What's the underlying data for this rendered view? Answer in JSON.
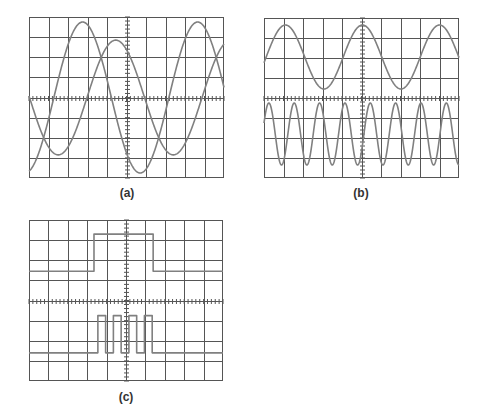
{
  "figure": {
    "style": {
      "grid_color": "#555555",
      "trace_color": "#808080",
      "background": "#ffffff",
      "divisions_x": 10,
      "divisions_y": 8,
      "minor_ticks_per_division": 5
    },
    "panels": [
      {
        "id": "a",
        "label": "(a)",
        "box": {
          "x": 29,
          "y": 17,
          "w": 195,
          "h": 161
        },
        "label_pos": {
          "x": 107,
          "y": 186
        },
        "traces": [
          {
            "name": "trace-1",
            "type": "sine",
            "offset": 0,
            "amplitude": 3.75,
            "period": 5.9,
            "phase_peak_x": 2.75
          },
          {
            "name": "trace-2",
            "type": "sine",
            "offset": 0,
            "amplitude": 2.85,
            "period": 5.9,
            "phase_peak_x": 4.45
          }
        ]
      },
      {
        "id": "b",
        "label": "(b)",
        "box": {
          "x": 264,
          "y": 18,
          "w": 195,
          "h": 160
        },
        "label_pos": {
          "x": 341,
          "y": 186
        },
        "traces": [
          {
            "name": "trace-top",
            "type": "sine",
            "offset": 2.05,
            "amplitude": 1.6,
            "period": 3.95,
            "phase_peak_x": 1.1
          },
          {
            "name": "trace-bottom",
            "type": "sine",
            "offset": -1.8,
            "amplitude": 1.55,
            "period": 1.3,
            "phase_peak_x": 0.25
          }
        ]
      },
      {
        "id": "c",
        "label": "(c)",
        "box": {
          "x": 29,
          "y": 220,
          "w": 194,
          "h": 161
        },
        "label_pos": {
          "x": 106,
          "y": 390
        },
        "traces": [
          {
            "name": "trace-single-pulse",
            "type": "pulses",
            "low": 1.45,
            "high": 3.3,
            "pulses": [
              [
                3.35,
                6.4
              ]
            ]
          },
          {
            "name": "trace-pulse-train",
            "type": "pulses",
            "low": -2.6,
            "high": -0.75,
            "pulses": [
              [
                3.55,
                3.95
              ],
              [
                4.35,
                4.75
              ],
              [
                5.15,
                5.55
              ],
              [
                5.95,
                6.35
              ]
            ]
          }
        ]
      }
    ]
  },
  "chart_data": [
    {
      "type": "line",
      "title": "(a)",
      "description": "Oscilloscope display, two sine waves of equal frequency with a phase difference",
      "grid": {
        "x_divisions": 10,
        "y_divisions": 8,
        "on": true
      },
      "xlabel": "",
      "ylabel": "",
      "series": [
        {
          "name": "Trace 1",
          "amplitude_div": 3.75,
          "period_div": 5.9,
          "first_peak_x_div": 2.75
        },
        {
          "name": "Trace 2",
          "amplitude_div": 2.85,
          "period_div": 5.9,
          "first_peak_x_div": 4.45
        }
      ]
    },
    {
      "type": "line",
      "title": "(b)",
      "description": "Oscilloscope display, low-frequency sine (top) and higher-frequency sine (bottom)",
      "grid": {
        "x_divisions": 10,
        "y_divisions": 8,
        "on": true
      },
      "xlabel": "",
      "ylabel": "",
      "series": [
        {
          "name": "Top trace",
          "offset_div": 2.05,
          "amplitude_div": 1.6,
          "period_div": 3.95
        },
        {
          "name": "Bottom trace",
          "offset_div": -1.8,
          "amplitude_div": 1.55,
          "period_div": 1.3
        }
      ]
    },
    {
      "type": "line",
      "title": "(c)",
      "description": "Oscilloscope display, single rectangular gate pulse (top) and burst of four pulses (bottom)",
      "grid": {
        "x_divisions": 10,
        "y_divisions": 8,
        "on": true
      },
      "xlabel": "",
      "ylabel": "",
      "series": [
        {
          "name": "Gate pulse",
          "low_div": 1.45,
          "high_div": 3.3,
          "pulses_x_div": [
            [
              3.35,
              6.4
            ]
          ]
        },
        {
          "name": "Pulse train",
          "low_div": -2.6,
          "high_div": -0.75,
          "pulses_x_div": [
            [
              3.55,
              3.95
            ],
            [
              4.35,
              4.75
            ],
            [
              5.15,
              5.55
            ],
            [
              5.95,
              6.35
            ]
          ]
        }
      ]
    }
  ]
}
